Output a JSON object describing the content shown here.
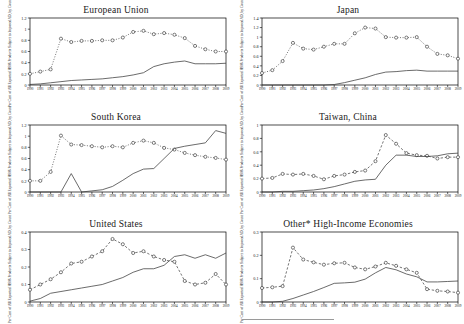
{
  "figure": {
    "y_axis_label": "Per Cent of All Exported HS06 Products Subject to Imposed AD, by Count",
    "x_axis_label": "",
    "years": [
      "1990",
      "1991",
      "1992",
      "1993",
      "1994",
      "1995",
      "1996",
      "1997",
      "1998",
      "1999",
      "2000",
      "2001",
      "2002",
      "2003",
      "2004",
      "2005",
      "2006",
      "2007",
      "2008",
      "2009"
    ],
    "colors": {
      "line_solid": "#444444",
      "line_marker": "#333333",
      "axis": "#000000",
      "background": "#ffffff"
    }
  },
  "chart_data": [
    {
      "type": "line",
      "title": "European Union",
      "xlabel": "",
      "ylabel": "Per Cent of All Exported HS06 Products Subject to Imposed AD, by Count",
      "x": [
        "1990",
        "1991",
        "1992",
        "1993",
        "1994",
        "1995",
        "1996",
        "1997",
        "1998",
        "1999",
        "2000",
        "2001",
        "2002",
        "2003",
        "2004",
        "2005",
        "2006",
        "2007",
        "2008",
        "2009"
      ],
      "ylim": [
        0,
        1.2
      ],
      "yticks": [
        0,
        0.2,
        0.4,
        0.6,
        0.8,
        1,
        1.2
      ],
      "ytick_labels": [
        "0",
        "0.2",
        "0.4",
        "0.6",
        "0.8",
        "1",
        "1.2"
      ],
      "grid": false,
      "legend": "none",
      "series": [
        {
          "name": "Stock of imposed AD (markers, dotted)",
          "style": "dotted-circle",
          "values": [
            0.2,
            0.24,
            0.28,
            0.83,
            0.77,
            0.79,
            0.79,
            0.8,
            0.8,
            0.85,
            0.95,
            0.97,
            0.91,
            0.93,
            0.9,
            0.84,
            0.7,
            0.64,
            0.6,
            0.6
          ]
        },
        {
          "name": "Flow of new AD (solid)",
          "style": "solid",
          "values": [
            0.01,
            0.02,
            0.04,
            0.06,
            0.08,
            0.09,
            0.1,
            0.11,
            0.13,
            0.15,
            0.18,
            0.22,
            0.33,
            0.38,
            0.41,
            0.43,
            0.38,
            0.38,
            0.38,
            0.39
          ]
        }
      ]
    },
    {
      "type": "line",
      "title": "Japan",
      "xlabel": "",
      "ylabel": "Per Cent of All Exported HS06 Products Subject to Imposed AD, by Count",
      "x": [
        "1990",
        "1991",
        "1992",
        "1993",
        "1994",
        "1995",
        "1996",
        "1997",
        "1998",
        "1999",
        "2000",
        "2001",
        "2002",
        "2003",
        "2004",
        "2005",
        "2006",
        "2007",
        "2008",
        "2009"
      ],
      "ylim": [
        0,
        1.4
      ],
      "yticks": [
        0,
        0.2,
        0.4,
        0.6,
        0.8,
        1,
        1.2,
        1.4
      ],
      "ytick_labels": [
        "0",
        "0.2",
        "0.4",
        "0.6",
        "0.8",
        "1",
        "1.2",
        "1.4"
      ],
      "grid": false,
      "legend": "none",
      "series": [
        {
          "name": "Stock of imposed AD (markers, dotted)",
          "style": "dotted-circle",
          "values": [
            0.25,
            0.31,
            0.5,
            0.88,
            0.76,
            0.74,
            0.8,
            0.86,
            0.86,
            1.08,
            1.2,
            1.18,
            1.0,
            0.99,
            0.99,
            1.0,
            0.8,
            0.65,
            0.62,
            0.55
          ]
        },
        {
          "name": "Flow of new AD (solid)",
          "style": "solid",
          "values": [
            0.0,
            0.0,
            0.0,
            0.0,
            0.0,
            0.0,
            0.0,
            0.01,
            0.05,
            0.1,
            0.15,
            0.22,
            0.27,
            0.28,
            0.3,
            0.31,
            0.29,
            0.29,
            0.29,
            0.29
          ]
        }
      ]
    },
    {
      "type": "line",
      "title": "South Korea",
      "xlabel": "",
      "ylabel": "Per Cent of All Exported HS06 Products Subject to Imposed AD, by Count",
      "x": [
        "1990",
        "1991",
        "1992",
        "1993",
        "1994",
        "1995",
        "1996",
        "1997",
        "1998",
        "1999",
        "2000",
        "2001",
        "2002",
        "2003",
        "2004",
        "2005",
        "2006",
        "2007",
        "2008",
        "2009"
      ],
      "ylim": [
        0,
        1.2
      ],
      "yticks": [
        0,
        0.2,
        0.4,
        0.6,
        0.8,
        1,
        1.2
      ],
      "ytick_labels": [
        "0",
        "0.2",
        "0.4",
        "0.6",
        "0.8",
        "1",
        "1.2"
      ],
      "grid": false,
      "legend": "none",
      "series": [
        {
          "name": "Stock of imposed AD (markers, dotted)",
          "style": "dotted-circle",
          "values": [
            0.2,
            0.2,
            0.36,
            1.01,
            0.85,
            0.84,
            0.82,
            0.8,
            0.82,
            0.8,
            0.88,
            0.92,
            0.88,
            0.79,
            0.76,
            0.7,
            0.66,
            0.63,
            0.61,
            0.58
          ]
        },
        {
          "name": "Flow of new AD (solid)",
          "style": "solid",
          "values": [
            0.0,
            0.0,
            0.0,
            0.0,
            0.33,
            0.0,
            0.02,
            0.04,
            0.1,
            0.21,
            0.33,
            0.41,
            0.42,
            0.6,
            0.78,
            0.82,
            0.85,
            0.88,
            1.1,
            1.05
          ]
        }
      ]
    },
    {
      "type": "line",
      "title": "Taiwan, China",
      "xlabel": "",
      "ylabel": "Per Cent of All Exported HS06 Products Subject to Imposed AD, by Count",
      "x": [
        "1990",
        "1991",
        "1992",
        "1993",
        "1994",
        "1995",
        "1996",
        "1997",
        "1998",
        "1999",
        "2000",
        "2001",
        "2002",
        "2003",
        "2004",
        "2005",
        "2006",
        "2007",
        "2008",
        "2009"
      ],
      "ylim": [
        0,
        1.0
      ],
      "yticks": [
        0,
        0.2,
        0.4,
        0.6,
        0.8,
        1
      ],
      "ytick_labels": [
        "0",
        "0.2",
        "0.4",
        "0.6",
        "0.8",
        "1"
      ],
      "grid": false,
      "legend": "none",
      "series": [
        {
          "name": "Stock of imposed AD (markers, dashed)",
          "style": "dashed-circle",
          "values": [
            0.2,
            0.21,
            0.27,
            0.26,
            0.27,
            0.24,
            0.19,
            0.24,
            0.26,
            0.3,
            0.32,
            0.46,
            0.85,
            0.72,
            0.58,
            0.55,
            0.54,
            0.5,
            0.52,
            0.52,
            0.54
          ]
        },
        {
          "name": "Flow of new AD (solid)",
          "style": "solid",
          "values": [
            0.0,
            0.0,
            0.01,
            0.01,
            0.02,
            0.03,
            0.05,
            0.08,
            0.12,
            0.16,
            0.18,
            0.19,
            0.4,
            0.55,
            0.55,
            0.53,
            0.53,
            0.54,
            0.57,
            0.58
          ]
        }
      ]
    },
    {
      "type": "line",
      "title": "United States",
      "xlabel": "",
      "ylabel": "Per Cent of All Exported HS06 Products Subject to Imposed AD, by Count",
      "x": [
        "1990",
        "1991",
        "1992",
        "1993",
        "1994",
        "1995",
        "1996",
        "1997",
        "1998",
        "1999",
        "2000",
        "2001",
        "2002",
        "2003",
        "2004",
        "2005",
        "2006",
        "2007",
        "2008",
        "2009"
      ],
      "ylim": [
        0,
        0.4
      ],
      "yticks": [
        0,
        0.1,
        0.2,
        0.3,
        0.4
      ],
      "ytick_labels": [
        "0",
        "0.1",
        "0.2",
        "0.3",
        "0.4"
      ],
      "grid": false,
      "legend": "none",
      "series": [
        {
          "name": "Stock of imposed AD (markers, dashed)",
          "style": "dashed-circle",
          "values": [
            0.07,
            0.1,
            0.13,
            0.17,
            0.22,
            0.23,
            0.26,
            0.29,
            0.36,
            0.33,
            0.28,
            0.29,
            0.26,
            0.24,
            0.23,
            0.12,
            0.1,
            0.11,
            0.16,
            0.1,
            0.13
          ]
        },
        {
          "name": "Flow of new AD (solid)",
          "style": "solid",
          "values": [
            0.005,
            0.02,
            0.05,
            0.06,
            0.07,
            0.08,
            0.09,
            0.1,
            0.12,
            0.14,
            0.17,
            0.19,
            0.19,
            0.21,
            0.26,
            0.27,
            0.25,
            0.27,
            0.25,
            0.28
          ]
        }
      ]
    },
    {
      "type": "line",
      "title": "Other* High-Income Economies",
      "xlabel": "",
      "ylabel": "Per Cent of All Exported HS06 Products Subject to Imposed AD, by Count",
      "x": [
        "1990",
        "1991",
        "1992",
        "1993",
        "1994",
        "1995",
        "1996",
        "1997",
        "1998",
        "1999",
        "2000",
        "2001",
        "2002",
        "2003",
        "2004",
        "2005",
        "2006",
        "2007",
        "2008",
        "2009"
      ],
      "ylim": [
        0,
        0.3
      ],
      "yticks": [
        0,
        0.1,
        0.2,
        0.3
      ],
      "ytick_labels": [
        "0",
        "0.1",
        "0.2",
        "0.3"
      ],
      "grid": false,
      "legend": "none",
      "series": [
        {
          "name": "Stock of imposed AD (markers, dashed)",
          "style": "dashed-circle",
          "values": [
            0.06,
            0.063,
            0.068,
            0.233,
            0.182,
            0.17,
            0.16,
            0.166,
            0.168,
            0.148,
            0.14,
            0.152,
            0.168,
            0.155,
            0.14,
            0.125,
            0.055,
            0.048,
            0.045,
            0.04
          ]
        },
        {
          "name": "Flow of new AD (solid)",
          "style": "solid",
          "values": [
            0.0,
            0.0,
            0.003,
            0.015,
            0.03,
            0.045,
            0.062,
            0.08,
            0.082,
            0.085,
            0.098,
            0.125,
            0.148,
            0.138,
            0.12,
            0.108,
            0.086,
            0.086,
            0.088,
            0.09
          ]
        }
      ]
    }
  ]
}
